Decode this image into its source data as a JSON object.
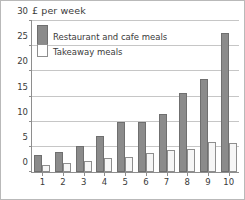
{
  "chart_data": {
    "type": "bar",
    "title": "",
    "ylabel": "£ per week",
    "xlabel": "",
    "ylim": [
      0,
      30
    ],
    "yticks": [
      0,
      5,
      10,
      15,
      20,
      25,
      30
    ],
    "grid": true,
    "legend_position": "top-left-inside",
    "categories": [
      "1",
      "2",
      "3",
      "4",
      "5",
      "6",
      "7",
      "8",
      "9",
      "10"
    ],
    "series": [
      {
        "name": "Restaurant and cafe meals",
        "color": "#8b8b8b",
        "values": [
          3.4,
          3.9,
          5.1,
          7.1,
          10.0,
          10.0,
          11.6,
          15.6,
          18.5,
          27.6
        ]
      },
      {
        "name": "Takeaway meals",
        "color": "#f6f6f6",
        "values": [
          1.4,
          1.8,
          2.1,
          2.8,
          2.9,
          3.8,
          4.4,
          4.6,
          5.9,
          5.8
        ]
      }
    ]
  },
  "legend": {
    "items": [
      {
        "label": "Restaurant and cafe meals"
      },
      {
        "label": "Takeaway meals"
      }
    ]
  },
  "axis": {
    "y_title": "£ per week"
  }
}
